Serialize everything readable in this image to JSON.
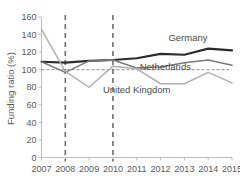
{
  "chart_data": {
    "type": "line",
    "title": "",
    "xlabel": "",
    "ylabel": "Funding ratio (%)",
    "x": [
      2007,
      2008,
      2009,
      2010,
      2011,
      2012,
      2013,
      2014,
      2015
    ],
    "xticklabels": [
      "2007",
      "2008",
      "2009",
      "2010",
      "2011",
      "2012",
      "2013",
      "2014",
      "2015"
    ],
    "yticklabels": [
      "0",
      "20",
      "40",
      "60",
      "80",
      "100",
      "120",
      "140",
      "160"
    ],
    "yticks": [
      0,
      20,
      40,
      60,
      80,
      100,
      120,
      140,
      160
    ],
    "ylim": [
      0,
      160
    ],
    "xlim": [
      2007,
      2015
    ],
    "grid": false,
    "legend_position": "inline-right",
    "series": [
      {
        "name": "Germany",
        "color": "#2b2b2b",
        "width": 2.1,
        "values": [
          109,
          108,
          110,
          111,
          113,
          118,
          117,
          124,
          122
        ]
      },
      {
        "name": "Netherlands",
        "color": "#7a7a7a",
        "width": 1.5,
        "values": [
          109,
          97,
          110,
          111,
          102,
          103,
          108,
          111,
          105
        ]
      },
      {
        "name": "United Kingdom",
        "color": "#b0b0b0",
        "width": 1.5,
        "values": [
          146,
          98,
          80,
          104,
          101,
          84,
          84,
          97,
          85
        ]
      }
    ],
    "reference_lines": [
      {
        "name": "full-funding-100",
        "orientation": "horizontal",
        "value": 100
      }
    ],
    "event_lines": [
      {
        "name": "event-2008",
        "orientation": "vertical",
        "value": 2008
      },
      {
        "name": "event-2010",
        "orientation": "vertical",
        "value": 2010
      }
    ],
    "annotations": [
      {
        "name": "germany-label",
        "text": "Germany",
        "x": 2013.15,
        "y": 133
      },
      {
        "name": "netherlands-label",
        "text": "Netherlands",
        "x": 2012.2,
        "y": 100
      },
      {
        "name": "uk-label",
        "text": "United  Kingdom",
        "x": 2011.0,
        "y": 74
      }
    ]
  }
}
